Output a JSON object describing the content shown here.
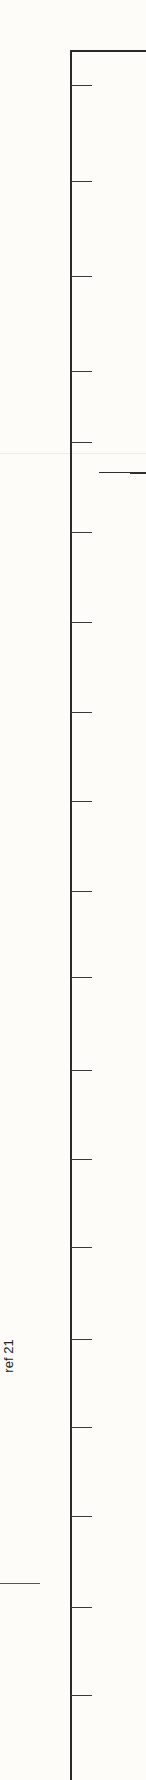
{
  "chart_data": {
    "type": "line",
    "title": "",
    "xlabel": "",
    "ylabel": "",
    "annotation": "ref 21",
    "axis": {
      "orientation": "vertical-left",
      "tick_positions_px": [
        85,
        181,
        276,
        371,
        442,
        532,
        622,
        712,
        801,
        891,
        977,
        1070,
        1159,
        1247,
        1339,
        1427,
        1516,
        1607,
        1695
      ],
      "tick_labels": []
    },
    "series": [
      {
        "name": "level-segment",
        "y_px": 472,
        "x_start_px": 99,
        "x_end_px": 146
      }
    ],
    "reference_marker": {
      "label": "ref 21",
      "y_px": 1583
    },
    "grid": false
  },
  "labels": {
    "ref": "ref 21"
  },
  "colors": {
    "background": "#fdfcf8",
    "axis": "#2a2a2a",
    "text": "#222222"
  }
}
